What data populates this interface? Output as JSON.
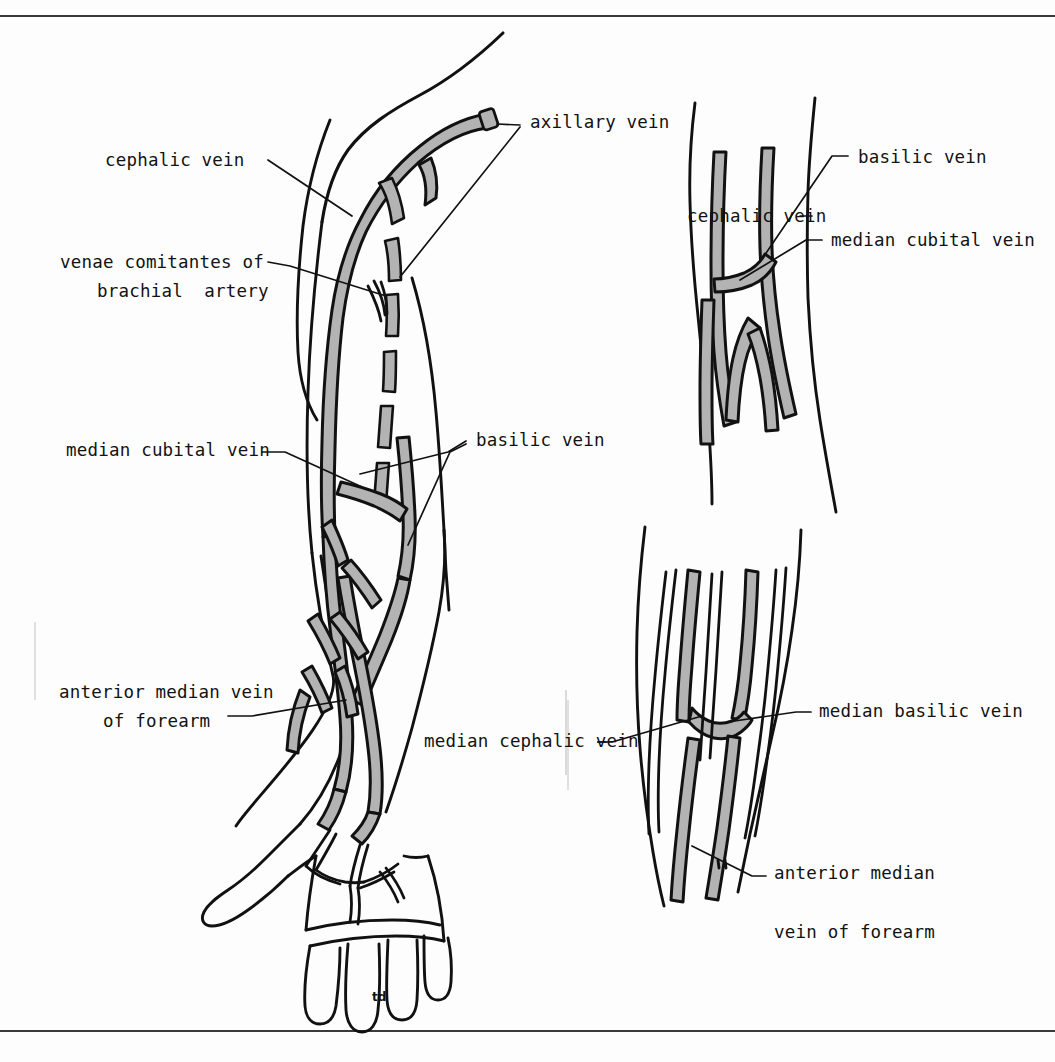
{
  "figure": {
    "signature": "td",
    "colors": {
      "vein_fill": "#b3b3b3",
      "outline": "#111111",
      "background": "#fdfdfd",
      "rule": "#3a3a3a",
      "label_text": "#121212"
    },
    "rules": {
      "top_y": 15,
      "bottom_y": 1030
    }
  },
  "main_diagram": {
    "name": "left upper limb, anterior view",
    "labels": [
      {
        "id": "cephalic-vein",
        "text": "cephalic vein",
        "x": 105,
        "y": 150
      },
      {
        "id": "venae-comitantes-1",
        "text": "venae comitantes of",
        "x": 60,
        "y": 252
      },
      {
        "id": "venae-comitantes-2",
        "text": "brachial  artery",
        "x": 97,
        "y": 281
      },
      {
        "id": "median-cubital-vein",
        "text": "median cubital vein",
        "x": 66,
        "y": 448
      },
      {
        "id": "anterior-median-1",
        "text": "anterior median vein",
        "x": 59,
        "y": 690
      },
      {
        "id": "anterior-median-2",
        "text": "of forearm",
        "x": 103,
        "y": 719
      },
      {
        "id": "axillary-vein",
        "text": "axillary vein",
        "x": 530,
        "y": 112
      },
      {
        "id": "basilic-vein",
        "text": "basilic vein",
        "x": 476,
        "y": 435
      },
      {
        "id": "median-cephalic-vein",
        "text": "median cephalic vein",
        "x": 424,
        "y": 736
      }
    ]
  },
  "inset_top_right": {
    "name": "cubital fossa variant - median cubital vein",
    "labels": [
      {
        "id": "inset1-basilic-vein",
        "text": "basilic vein",
        "x": 858,
        "y": 150
      },
      {
        "id": "inset1-cephalic-vein",
        "text": "cephalic vein",
        "x": 687,
        "y": 208
      },
      {
        "id": "inset1-median-cubital-vein",
        "text": "median cubital vein",
        "x": 831,
        "y": 233
      }
    ]
  },
  "inset_bottom_right": {
    "name": "cubital fossa variant - median cephalic and median basilic veins",
    "labels": [
      {
        "id": "inset2-median-basilic-vein",
        "text": "median basilic vein",
        "x": 819,
        "y": 706
      },
      {
        "id": "inset2-anterior-median-1",
        "text": "anterior median",
        "x": 774,
        "y": 869
      },
      {
        "id": "inset2-anterior-median-2",
        "text": "vein of forearm",
        "x": 774,
        "y": 928
      }
    ]
  }
}
